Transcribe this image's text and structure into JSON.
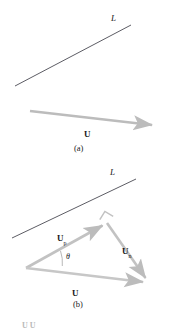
{
  "figure": {
    "title_visible": false,
    "background_color": "#ffffff",
    "line_color": "#4a4a52",
    "vector_color": "#bcbcbc",
    "text_color": "#1a1a1a"
  },
  "panel_a": {
    "caption": "(a)",
    "line_label": "L",
    "vector_label": "U",
    "line": {
      "name": "line-L-a",
      "x1": 15,
      "y1": 86,
      "x2": 131,
      "y2": 25
    },
    "vector": {
      "name": "vector-U-a",
      "x1": 30,
      "y1": 111,
      "x2": 159,
      "y2": 126
    }
  },
  "panel_b": {
    "caption": "(b)",
    "line_label": "L",
    "line": {
      "name": "line-L-b",
      "x1": 12,
      "y1": 238,
      "x2": 136,
      "y2": 179
    },
    "vectors": [
      {
        "name": "vector-Up",
        "label": "U",
        "subscript": "p",
        "x1": 26,
        "y1": 268,
        "x2": 107,
        "y2": 223
      },
      {
        "name": "vector-Un",
        "label": "U",
        "subscript": "n",
        "x1": 107,
        "y1": 223,
        "x2": 149,
        "y2": 283
      },
      {
        "name": "vector-U",
        "label": "U",
        "subscript": "",
        "x1": 26,
        "y1": 268,
        "x2": 149,
        "y2": 283
      }
    ],
    "angle_label": "θ",
    "right_angle_marker": true
  },
  "footer": {
    "partial_text": "U U"
  }
}
